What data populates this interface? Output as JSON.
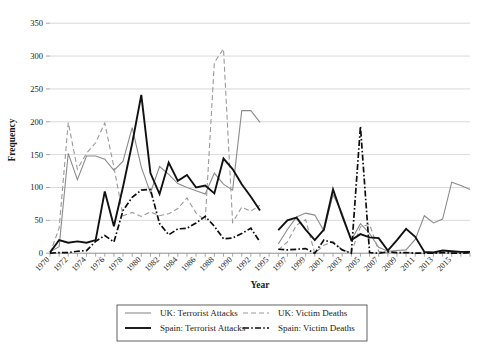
{
  "chart_data": {
    "type": "line",
    "title": "",
    "xlabel": "Year",
    "ylabel": "Frequency",
    "ylim": [
      0,
      350
    ],
    "ytick_values": [
      0,
      50,
      100,
      150,
      200,
      250,
      300,
      350
    ],
    "ytick_labels": [
      "0",
      "50",
      "100",
      "150",
      "200",
      "250",
      "300",
      "350"
    ],
    "grid": true,
    "legend_position": "bottom-center",
    "xlim": [
      1970,
      2016
    ],
    "xtick_labels": [
      "1970",
      "1972",
      "1974",
      "1976",
      "1978",
      "1980",
      "1982",
      "1984",
      "1986",
      "1988",
      "1990",
      "1992",
      "1995",
      "1997",
      "1999",
      "2001",
      "2003",
      "2005",
      "2007",
      "2009",
      "2011",
      "2013",
      "2015"
    ],
    "x": [
      1970,
      1971,
      1972,
      1973,
      1974,
      1975,
      1976,
      1977,
      1978,
      1979,
      1980,
      1981,
      1982,
      1983,
      1984,
      1985,
      1986,
      1987,
      1988,
      1989,
      1990,
      1991,
      1992,
      1993,
      1994,
      1995,
      1996,
      1997,
      1998,
      1999,
      2000,
      2001,
      2002,
      2003,
      2004,
      2005,
      2006,
      2007,
      2008,
      2009,
      2010,
      2011,
      2012,
      2013,
      2014,
      2015,
      2016
    ],
    "series": [
      {
        "name": "UK: Terrorist Attacks",
        "color": "#8c8c8c",
        "style": "solid",
        "width": 1.1,
        "values": [
          2,
          10,
          152,
          112,
          148,
          148,
          143,
          126,
          140,
          191,
          131,
          92,
          132,
          120,
          106,
          100,
          95,
          90,
          122,
          105,
          96,
          217,
          217,
          199,
          null,
          14,
          36,
          55,
          61,
          58,
          34,
          89,
          61,
          20,
          45,
          30,
          9,
          3,
          4,
          5,
          21,
          57,
          46,
          52,
          108,
          103,
          97
        ]
      },
      {
        "name": "UK: Victim Deaths",
        "color": "#9a9a9a",
        "style": "dashed",
        "width": 1.1,
        "values": [
          0,
          38,
          199,
          128,
          152,
          168,
          198,
          131,
          57,
          62,
          56,
          63,
          57,
          60,
          68,
          84,
          61,
          50,
          290,
          311,
          47,
          70,
          64,
          73,
          null,
          5,
          17,
          43,
          51,
          0,
          12,
          18,
          5,
          1,
          40,
          44,
          3,
          1,
          0,
          1,
          0,
          0,
          0,
          0,
          1,
          2,
          3
        ]
      },
      {
        "name": "Spain: Terrorist Attacks",
        "color": "#111111",
        "style": "solid",
        "width": 1.9,
        "values": [
          1,
          20,
          16,
          18,
          16,
          20,
          94,
          41,
          101,
          167,
          241,
          122,
          90,
          138,
          110,
          119,
          100,
          103,
          91,
          144,
          128,
          105,
          86,
          65,
          null,
          35,
          50,
          54,
          36,
          20,
          36,
          97,
          57,
          20,
          29,
          24,
          23,
          4,
          20,
          37,
          25,
          2,
          1,
          4,
          3,
          2,
          2
        ]
      },
      {
        "name": "Spain: Victim Deaths",
        "color": "#0d0d0d",
        "style": "dashdot",
        "width": 1.7,
        "values": [
          0,
          1,
          1,
          3,
          4,
          18,
          27,
          17,
          65,
          85,
          96,
          97,
          45,
          28,
          37,
          38,
          46,
          56,
          41,
          22,
          23,
          30,
          38,
          17,
          null,
          6,
          5,
          6,
          7,
          0,
          20,
          16,
          5,
          0,
          193,
          1,
          0,
          2,
          1,
          1,
          0,
          0,
          0,
          1,
          0,
          0,
          1
        ]
      }
    ]
  },
  "legend": {
    "entries": [
      {
        "label": "UK: Terrorist Attacks",
        "series_index": 0
      },
      {
        "label": "UK: Victim Deaths",
        "series_index": 1
      },
      {
        "label": "Spain: Terrorist Attacks",
        "series_index": 2
      },
      {
        "label": "Spain: Victim Deaths",
        "series_index": 3
      }
    ]
  }
}
